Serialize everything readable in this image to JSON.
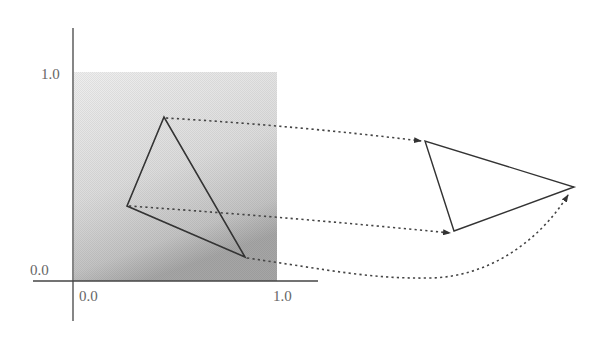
{
  "diagram": {
    "type": "texture-coordinate-mapping",
    "axes": {
      "x_tick_labels": [
        "0.0",
        "1.0"
      ],
      "y_tick_labels": [
        "0.0",
        "1.0"
      ]
    },
    "colors": {
      "axis": "#444444",
      "triangle": "#333333",
      "arrow": "#444444",
      "texture_light": "#ededed",
      "texture_dark": "#a8a8a8"
    },
    "source_triangle": {
      "label": "texture-space triangle",
      "vertices_px": [
        [
          164,
          117
        ],
        [
          127,
          206
        ],
        [
          245,
          257
        ]
      ],
      "vertices_uv": [
        [
          0.45,
          0.74
        ],
        [
          0.27,
          0.36
        ],
        [
          0.84,
          0.12
        ]
      ]
    },
    "target_triangle": {
      "label": "screen-space triangle",
      "vertices_px": [
        [
          425,
          141
        ],
        [
          454,
          231
        ],
        [
          574,
          187
        ]
      ]
    },
    "mappings": [
      {
        "from": 0,
        "to": 0,
        "style": "dotted-arrow-straight"
      },
      {
        "from": 1,
        "to": 1,
        "style": "dotted-arrow-straight"
      },
      {
        "from": 2,
        "to": 2,
        "style": "dotted-arrow-curved"
      }
    ]
  }
}
